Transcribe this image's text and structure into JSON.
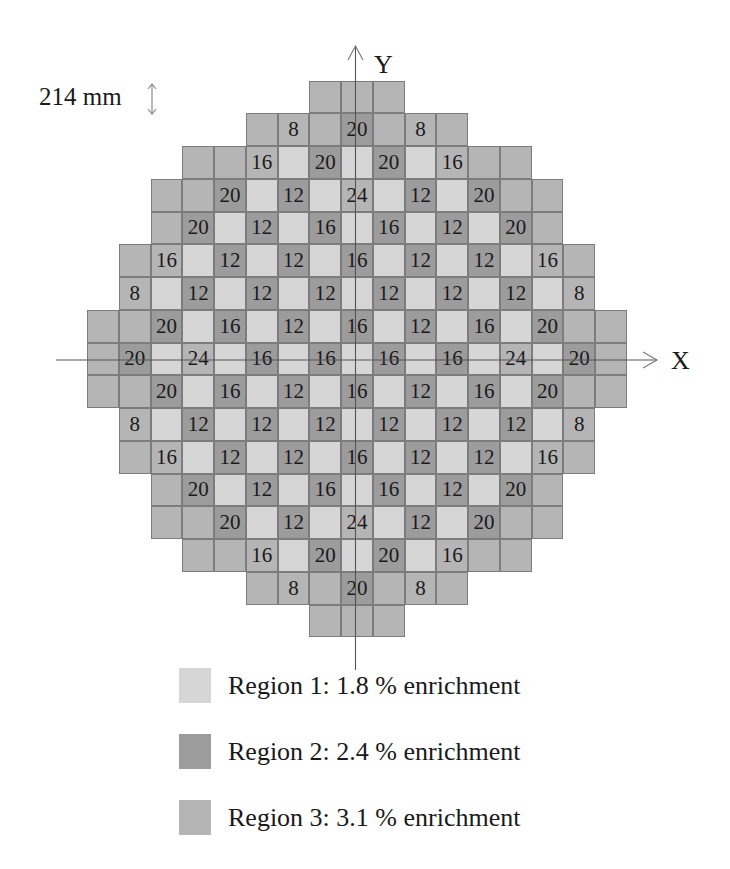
{
  "scale": {
    "label": "214 mm",
    "icon": "double-arrow-vertical-icon"
  },
  "axes": {
    "x_label": "X",
    "y_label": "Y"
  },
  "colors": {
    "region1": "#d6d6d6",
    "region2": "#9c9c9c",
    "region3": "#b5b5b5",
    "border": "#7c7c7c"
  },
  "legend": [
    {
      "region": 1,
      "label": "Region 1: 1.8 % enrichment"
    },
    {
      "region": 2,
      "label": "Region 2: 2.4 % enrichment"
    },
    {
      "region": 3,
      "label": "Region 3: 3.1 % enrichment"
    }
  ],
  "chart_data": {
    "type": "heatmap",
    "xlabel": "X",
    "ylabel": "Y",
    "grid_size": [
      17,
      17
    ],
    "cell_pitch": "214 mm",
    "legend": [
      "Region 1: 1.8 % enrichment",
      "Region 2: 2.4 % enrichment",
      "Region 3: 3.1 % enrichment"
    ],
    "rows": [
      {
        "start": 7,
        "region": [
          3,
          3,
          3
        ],
        "label": [
          "",
          "",
          ""
        ]
      },
      {
        "start": 5,
        "region": [
          3,
          3,
          3,
          2,
          3,
          3,
          3
        ],
        "label": [
          "",
          "8",
          "",
          "20",
          "",
          "8",
          ""
        ]
      },
      {
        "start": 3,
        "region": [
          3,
          3,
          3,
          1,
          2,
          1,
          2,
          1,
          3,
          3,
          3
        ],
        "label": [
          "",
          "",
          "16",
          "",
          "20",
          "",
          "20",
          "",
          "16",
          "",
          ""
        ]
      },
      {
        "start": 2,
        "region": [
          3,
          3,
          2,
          1,
          2,
          1,
          3,
          1,
          2,
          1,
          2,
          3,
          3
        ],
        "label": [
          "",
          "",
          "20",
          "",
          "12",
          "",
          "24",
          "",
          "12",
          "",
          "20",
          "",
          ""
        ]
      },
      {
        "start": 2,
        "region": [
          3,
          2,
          1,
          2,
          1,
          2,
          1,
          2,
          1,
          2,
          1,
          2,
          3
        ],
        "label": [
          "",
          "20",
          "",
          "12",
          "",
          "16",
          "",
          "16",
          "",
          "12",
          "",
          "20",
          ""
        ]
      },
      {
        "start": 1,
        "region": [
          3,
          3,
          1,
          2,
          1,
          2,
          1,
          2,
          1,
          2,
          1,
          2,
          1,
          3,
          3
        ],
        "label": [
          "",
          "16",
          "",
          "12",
          "",
          "12",
          "",
          "16",
          "",
          "12",
          "",
          "12",
          "",
          "16",
          ""
        ]
      },
      {
        "start": 1,
        "region": [
          3,
          1,
          2,
          1,
          2,
          1,
          2,
          1,
          2,
          1,
          2,
          1,
          2,
          1,
          3
        ],
        "label": [
          "8",
          "",
          "12",
          "",
          "12",
          "",
          "12",
          "",
          "12",
          "",
          "12",
          "",
          "12",
          "",
          "8"
        ]
      },
      {
        "start": 0,
        "region": [
          3,
          3,
          2,
          1,
          2,
          1,
          2,
          1,
          2,
          1,
          2,
          1,
          2,
          1,
          2,
          3,
          3
        ],
        "label": [
          "",
          "",
          "20",
          "",
          "16",
          "",
          "12",
          "",
          "16",
          "",
          "12",
          "",
          "16",
          "",
          "20",
          "",
          ""
        ]
      },
      {
        "start": 0,
        "region": [
          3,
          2,
          1,
          3,
          1,
          2,
          1,
          2,
          1,
          2,
          1,
          2,
          1,
          3,
          1,
          2,
          3
        ],
        "label": [
          "",
          "20",
          "",
          "24",
          "",
          "16",
          "",
          "16",
          "",
          "16",
          "",
          "16",
          "",
          "24",
          "",
          "20",
          ""
        ]
      },
      {
        "start": 0,
        "region": [
          3,
          3,
          2,
          1,
          2,
          1,
          2,
          1,
          2,
          1,
          2,
          1,
          2,
          1,
          2,
          3,
          3
        ],
        "label": [
          "",
          "",
          "20",
          "",
          "16",
          "",
          "12",
          "",
          "16",
          "",
          "12",
          "",
          "16",
          "",
          "20",
          "",
          ""
        ]
      },
      {
        "start": 1,
        "region": [
          3,
          1,
          2,
          1,
          2,
          1,
          2,
          1,
          2,
          1,
          2,
          1,
          2,
          1,
          3
        ],
        "label": [
          "8",
          "",
          "12",
          "",
          "12",
          "",
          "12",
          "",
          "12",
          "",
          "12",
          "",
          "12",
          "",
          "8"
        ]
      },
      {
        "start": 1,
        "region": [
          3,
          3,
          1,
          2,
          1,
          2,
          1,
          2,
          1,
          2,
          1,
          2,
          1,
          3,
          3
        ],
        "label": [
          "",
          "16",
          "",
          "12",
          "",
          "12",
          "",
          "16",
          "",
          "12",
          "",
          "12",
          "",
          "16",
          ""
        ]
      },
      {
        "start": 2,
        "region": [
          3,
          2,
          1,
          2,
          1,
          2,
          1,
          2,
          1,
          2,
          1,
          2,
          3
        ],
        "label": [
          "",
          "20",
          "",
          "12",
          "",
          "16",
          "",
          "16",
          "",
          "12",
          "",
          "20",
          ""
        ]
      },
      {
        "start": 2,
        "region": [
          3,
          3,
          2,
          1,
          2,
          1,
          3,
          1,
          2,
          1,
          2,
          3,
          3
        ],
        "label": [
          "",
          "",
          "20",
          "",
          "12",
          "",
          "24",
          "",
          "12",
          "",
          "20",
          "",
          ""
        ]
      },
      {
        "start": 3,
        "region": [
          3,
          3,
          3,
          1,
          2,
          1,
          2,
          1,
          3,
          3,
          3
        ],
        "label": [
          "",
          "",
          "16",
          "",
          "20",
          "",
          "20",
          "",
          "16",
          "",
          ""
        ]
      },
      {
        "start": 5,
        "region": [
          3,
          3,
          3,
          2,
          3,
          3,
          3
        ],
        "label": [
          "",
          "8",
          "",
          "20",
          "",
          "8",
          ""
        ]
      },
      {
        "start": 7,
        "region": [
          3,
          3,
          3
        ],
        "label": [
          "",
          "",
          ""
        ]
      }
    ]
  }
}
